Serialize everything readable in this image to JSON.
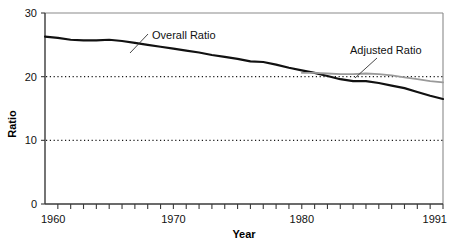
{
  "chart_data": {
    "type": "line",
    "title": "",
    "xlabel": "Year",
    "ylabel": "Ratio",
    "xlim": [
      1960,
      1991
    ],
    "ylim": [
      0,
      30
    ],
    "grid": "horizontal dotted at y=10 and y=20",
    "legend_position": "inline annotations with leader lines",
    "y_ticks": [
      0,
      10,
      20,
      30
    ],
    "y_tick_labels": [
      "0",
      "10",
      "20",
      "30"
    ],
    "x_ticks": [
      1960,
      1970,
      1980,
      1991
    ],
    "x_tick_labels": [
      "1960",
      "1970",
      "1980",
      "1991"
    ],
    "x_minor_tick_step": 1,
    "gridline_values": [
      10,
      20
    ],
    "series": [
      {
        "name": "Overall Ratio",
        "color": "#111111",
        "label_text": "Overall Ratio",
        "x": [
          1960,
          1961,
          1962,
          1963,
          1964,
          1965,
          1966,
          1967,
          1968,
          1969,
          1970,
          1971,
          1972,
          1973,
          1974,
          1975,
          1976,
          1977,
          1978,
          1979,
          1980,
          1981,
          1982,
          1983,
          1984,
          1985,
          1986,
          1987,
          1988,
          1989,
          1990,
          1991
        ],
        "values": [
          26.3,
          26.1,
          25.8,
          25.7,
          25.7,
          25.8,
          25.6,
          25.3,
          25.0,
          24.7,
          24.4,
          24.1,
          23.8,
          23.4,
          23.1,
          22.8,
          22.4,
          22.3,
          21.9,
          21.4,
          21.0,
          20.6,
          20.1,
          19.6,
          19.3,
          19.3,
          19.0,
          18.6,
          18.2,
          17.6,
          17.0,
          16.5
        ]
      },
      {
        "name": "Adjusted Ratio",
        "color": "#9a9a9a",
        "label_text": "Adjusted Ratio",
        "x": [
          1980,
          1981,
          1982,
          1983,
          1984,
          1985,
          1986,
          1987,
          1988,
          1989,
          1990,
          1991
        ],
        "values": [
          20.6,
          20.6,
          20.5,
          20.4,
          20.4,
          20.5,
          20.4,
          20.2,
          19.9,
          19.6,
          19.3,
          19.1
        ]
      }
    ],
    "annotations": [
      {
        "text": "Overall Ratio",
        "text_x": 152,
        "text_y": 39,
        "leader_from_x": 148,
        "leader_from_y": 34,
        "leader_to_x": 130,
        "leader_to_y": 53
      },
      {
        "text": "Adjusted Ratio",
        "text_x": 350,
        "text_y": 54,
        "leader_from_x": 377,
        "leader_from_y": 58,
        "leader_to_x": 355,
        "leader_to_y": 78
      }
    ]
  },
  "axes": {
    "y_title": "Ratio",
    "x_title": "Year"
  }
}
